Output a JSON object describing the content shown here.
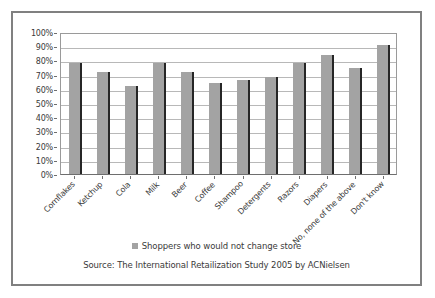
{
  "chart_data": {
    "type": "bar",
    "title": "",
    "xlabel": "",
    "ylabel": "",
    "ylim": [
      0,
      100
    ],
    "grid": true,
    "legend_position": "bottom",
    "categories": [
      "Cornflakes",
      "Ketchup",
      "Cola",
      "Milk",
      "Beer",
      "Coffee",
      "Shampoo",
      "Detergents",
      "Razors",
      "Diapers",
      "No, none of the above",
      "Don't know"
    ],
    "series": [
      {
        "name": "Shoppers who would not change store",
        "values": [
          78,
          72,
          62,
          78,
          72,
          64,
          66,
          68,
          78,
          84,
          75,
          91
        ]
      }
    ],
    "ytick_labels": [
      "0%",
      "10%",
      "20%",
      "30%",
      "40%",
      "50%",
      "60%",
      "70%",
      "80%",
      "90%",
      "100%"
    ],
    "ytick_values": [
      0,
      10,
      20,
      30,
      40,
      50,
      60,
      70,
      80,
      90,
      100
    ],
    "bar_color": "#a3a3a3",
    "grid_color": "#b8b8b8",
    "axis_color": "#6e6e6e"
  },
  "legend": {
    "label": "Shoppers who would not change store"
  },
  "source": {
    "text": "Source: The International Retailization Study 2005 by ACNielsen"
  },
  "frame": {
    "border_color": "#808080"
  }
}
